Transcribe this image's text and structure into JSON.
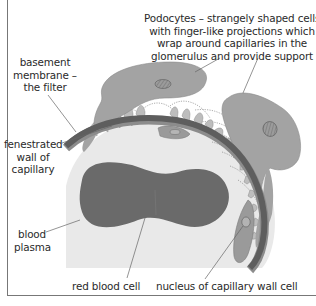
{
  "diagram": {
    "title_cutoff": "",
    "colors": {
      "background": "#ffffff",
      "plasma": "#e9e9e9",
      "capillary_wall": "#5e5e5e",
      "red_blood_cell": "#6a6a6a",
      "podocyte": "#a3a3a3",
      "podocyte_foot": "#b8b8b8",
      "endothelial_nucleus": "#9a9a9a",
      "leader_line": "#666666",
      "text": "#2a2a2a",
      "frame": "#777777"
    },
    "labels": {
      "podocytes": [
        "Podocytes – strangely shaped cells",
        "with finger-like projections which",
        "wrap around capillaries in the",
        "glomerulus and provide support"
      ],
      "basement_membrane": [
        "basement",
        "membrane –",
        "the filter"
      ],
      "fenestrated_wall": [
        "fenestrated",
        "wall of",
        "capillary"
      ],
      "blood_plasma": [
        "blood",
        "plasma"
      ],
      "red_blood_cell": "red blood cell",
      "nucleus": "nucleus of capillary wall cell"
    },
    "structures": [
      "podocyte (top)",
      "podocyte (right)",
      "podocyte foot processes",
      "basement membrane",
      "fenestrated capillary wall",
      "blood plasma",
      "red blood cell",
      "capillary wall cell with nucleus"
    ]
  }
}
